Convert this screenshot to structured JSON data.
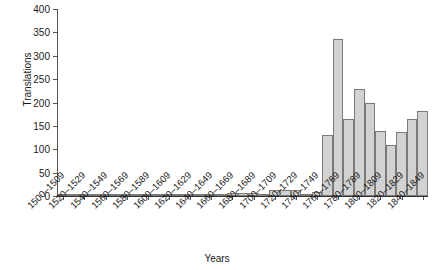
{
  "chart_data": {
    "type": "bar",
    "title": "",
    "xlabel": "Years",
    "ylabel": "Translations",
    "ylim": [
      0,
      400
    ],
    "yticks": [
      0,
      50,
      100,
      150,
      200,
      250,
      300,
      350,
      400
    ],
    "grid": false,
    "legend": null,
    "bin_width_years": 10,
    "label_every_n_bins": 2,
    "categories": [
      "1500-1509",
      "1510-1519",
      "1520-1529",
      "1530-1539",
      "1540-1549",
      "1550-1559",
      "1560-1569",
      "1570-1579",
      "1580-1589",
      "1590-1599",
      "1600-1609",
      "1610-1619",
      "1620-1629",
      "1630-1639",
      "1640-1649",
      "1650-1659",
      "1660-1669",
      "1670-1679",
      "1680-1689",
      "1690-1699",
      "1700-1709",
      "1710-1719",
      "1720-1729",
      "1730-1739",
      "1740-1749",
      "1750-1759",
      "1760-1769",
      "1770-1779",
      "1780-1789",
      "1790-1799",
      "1800-1809",
      "1810-1819",
      "1820-1829",
      "1830-1839",
      "1840-1849"
    ],
    "values": [
      1,
      1,
      2,
      1,
      2,
      2,
      3,
      2,
      4,
      4,
      5,
      3,
      3,
      2,
      2,
      3,
      7,
      6,
      6,
      3,
      13,
      12,
      12,
      5,
      9,
      130,
      335,
      165,
      228,
      200,
      140,
      110,
      138,
      165,
      182
    ],
    "tick_labels_shown": [
      "1500-1509",
      "1520-1529",
      "1540-1549",
      "1560-1569",
      "1580-1589",
      "1600-1609",
      "1620-1629",
      "1640-1649",
      "1660-1669",
      "1680-1689",
      "1700-1709",
      "1720-1729",
      "1740-1749",
      "1760-1769",
      "1780-1789",
      "1800-1809",
      "1820-1829",
      "1840-1849"
    ],
    "colors": {
      "bar_fill": "#d2d2d2",
      "bar_stroke": "#7a7a7a",
      "axis": "#333333",
      "text": "#1a1a1a"
    }
  }
}
